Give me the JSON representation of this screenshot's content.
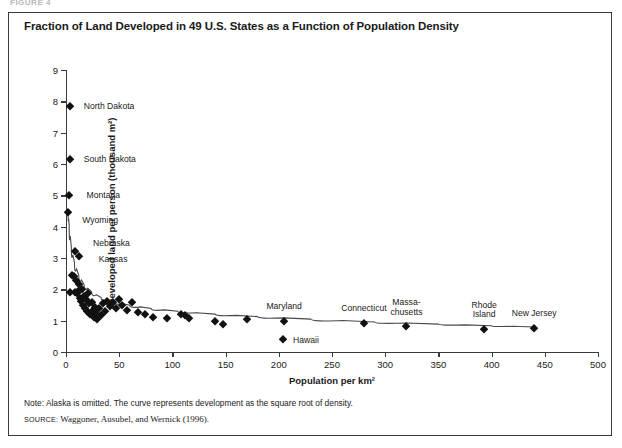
{
  "figure": {
    "top_sliver": "FIGURE 4",
    "title": "Fraction of Land Developed in 49 U.S. States as a Function of Population Density",
    "note": "Note: Alaska is omitted. The curve represents development as the square root of density.",
    "source_label": "SOURCE:",
    "source_text": "Waggoner, Ausubel, and Wernick (1996).",
    "frame_color": "#3a3a3a",
    "marker_color": "#111111"
  },
  "chart_data": {
    "type": "scatter",
    "title": "Fraction of Land Developed in 49 U.S. States as a Function of Population Density",
    "xlabel": "Population per km²",
    "ylabel": "Developed land per person (thousand m²)",
    "xlim": [
      0,
      500
    ],
    "ylim": [
      0,
      9
    ],
    "xticks": [
      0,
      50,
      100,
      150,
      200,
      250,
      300,
      350,
      400,
      450,
      500
    ],
    "yticks": [
      0,
      1,
      2,
      3,
      4,
      5,
      6,
      7,
      8,
      9
    ],
    "xticklabels": [
      "0",
      "50",
      "100",
      "150",
      "200",
      "250",
      "300",
      "350",
      "400",
      "450",
      "500"
    ],
    "yticklabels": [
      "0",
      "1",
      "2",
      "3",
      "4",
      "5",
      "6",
      "7",
      "8",
      "9"
    ],
    "grid": false,
    "legend": null,
    "points": [
      {
        "x": 3.5,
        "y": 7.85,
        "label": "North Dakota",
        "lx": 14,
        "ly": -4,
        "lines": 1
      },
      {
        "x": 3.6,
        "y": 6.15,
        "label": "South Dakota",
        "lx": 14,
        "ly": -4,
        "lines": 1
      },
      {
        "x": 2.4,
        "y": 5.0,
        "label": "Montana",
        "lx": 18,
        "ly": -4,
        "lines": 1
      },
      {
        "x": 2.1,
        "y": 4.48,
        "label": "Wyoming",
        "lx": 14,
        "ly": 4,
        "lines": 1
      },
      {
        "x": 8.5,
        "y": 3.22,
        "label": "Nebraska",
        "lx": 18,
        "ly": -12,
        "lines": 1
      },
      {
        "x": 12.0,
        "y": 3.05,
        "label": "Kansas",
        "lx": 20,
        "ly": -1,
        "lines": 1
      },
      {
        "x": 204,
        "y": 0.42,
        "label": "Hawaii",
        "lx": 10,
        "ly": -3,
        "lines": 1
      },
      {
        "x": 205,
        "y": 1.0,
        "label": "Maryland",
        "lx": 0,
        "ly": -19,
        "lines": 1
      },
      {
        "x": 280,
        "y": 0.92,
        "label": "Connecticut",
        "lx": 0,
        "ly": -19,
        "lines": 1
      },
      {
        "x": 320,
        "y": 0.82,
        "label": "Massa-chusetts",
        "lx": 0,
        "ly": -28,
        "lines": 2
      },
      {
        "x": 393,
        "y": 0.75,
        "label": "Rhode Island",
        "lx": 0,
        "ly": -28,
        "lines": 2
      },
      {
        "x": 440,
        "y": 0.78,
        "label": "New Jersey",
        "lx": 0,
        "ly": -19,
        "lines": 1
      },
      {
        "x": 4.0,
        "y": 1.9
      },
      {
        "x": 6.0,
        "y": 2.45
      },
      {
        "x": 7.5,
        "y": 2.42
      },
      {
        "x": 8.0,
        "y": 1.92
      },
      {
        "x": 9.0,
        "y": 2.3
      },
      {
        "x": 10.0,
        "y": 1.88
      },
      {
        "x": 11.0,
        "y": 1.95
      },
      {
        "x": 12.5,
        "y": 2.18
      },
      {
        "x": 13.0,
        "y": 1.72
      },
      {
        "x": 14.0,
        "y": 1.62
      },
      {
        "x": 15.0,
        "y": 2.0
      },
      {
        "x": 16.0,
        "y": 1.5
      },
      {
        "x": 17.0,
        "y": 1.8
      },
      {
        "x": 18.0,
        "y": 1.42
      },
      {
        "x": 19.0,
        "y": 1.7
      },
      {
        "x": 20.0,
        "y": 1.3
      },
      {
        "x": 21.0,
        "y": 1.88
      },
      {
        "x": 22.0,
        "y": 1.55
      },
      {
        "x": 23.0,
        "y": 1.22
      },
      {
        "x": 24.0,
        "y": 1.6
      },
      {
        "x": 25.0,
        "y": 1.35
      },
      {
        "x": 26.0,
        "y": 1.12
      },
      {
        "x": 27.0,
        "y": 1.45
      },
      {
        "x": 28.0,
        "y": 1.25
      },
      {
        "x": 29.5,
        "y": 1.05
      },
      {
        "x": 31.0,
        "y": 1.4
      },
      {
        "x": 33.0,
        "y": 1.18
      },
      {
        "x": 35.0,
        "y": 1.55
      },
      {
        "x": 37.0,
        "y": 1.32
      },
      {
        "x": 39.0,
        "y": 1.62
      },
      {
        "x": 41.0,
        "y": 1.48
      },
      {
        "x": 44.0,
        "y": 1.58
      },
      {
        "x": 47.0,
        "y": 1.42
      },
      {
        "x": 50.0,
        "y": 1.7
      },
      {
        "x": 53.0,
        "y": 1.5
      },
      {
        "x": 57.0,
        "y": 1.35
      },
      {
        "x": 62.0,
        "y": 1.6
      },
      {
        "x": 68.0,
        "y": 1.28
      },
      {
        "x": 74.0,
        "y": 1.2
      },
      {
        "x": 82.0,
        "y": 1.12
      },
      {
        "x": 95.0,
        "y": 1.08
      },
      {
        "x": 108,
        "y": 1.22
      },
      {
        "x": 112,
        "y": 1.18
      },
      {
        "x": 116,
        "y": 1.08
      },
      {
        "x": 140,
        "y": 0.98
      },
      {
        "x": 148,
        "y": 0.88
      },
      {
        "x": 170,
        "y": 1.05
      }
    ],
    "curve": {
      "description": "fitted curve: development as the square root of density",
      "points": [
        {
          "x": 2,
          "y": 4.45
        },
        {
          "x": 3,
          "y": 4.05
        },
        {
          "x": 5,
          "y": 3.35
        },
        {
          "x": 8,
          "y": 2.85
        },
        {
          "x": 12,
          "y": 2.45
        },
        {
          "x": 17,
          "y": 2.15
        },
        {
          "x": 24,
          "y": 1.92
        },
        {
          "x": 33,
          "y": 1.74
        },
        {
          "x": 45,
          "y": 1.6
        },
        {
          "x": 60,
          "y": 1.49
        },
        {
          "x": 80,
          "y": 1.39
        },
        {
          "x": 105,
          "y": 1.3
        },
        {
          "x": 140,
          "y": 1.21
        },
        {
          "x": 180,
          "y": 1.13
        },
        {
          "x": 230,
          "y": 1.05
        },
        {
          "x": 290,
          "y": 0.96
        },
        {
          "x": 350,
          "y": 0.89
        },
        {
          "x": 400,
          "y": 0.84
        },
        {
          "x": 440,
          "y": 0.8
        }
      ]
    }
  }
}
